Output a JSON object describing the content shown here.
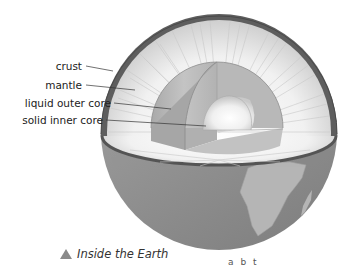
{
  "figure": {
    "labels": [
      {
        "id": "crust",
        "text": "crust"
      },
      {
        "id": "mantle",
        "text": "mantle"
      },
      {
        "id": "outer-core",
        "text": "liquid outer core"
      },
      {
        "id": "inner-core",
        "text": "solid inner core"
      }
    ],
    "caption": {
      "icon": "triangle-up-icon",
      "text": "Inside the Earth"
    },
    "fragment_text": "a b t",
    "colors": {
      "crust": "#5e5e5e",
      "mantle_light": "#f4f4f4",
      "mantle_streak": "#bdbdbd",
      "outer_core": "#b4b4b4",
      "inner_core": "#f5f5f5",
      "ocean": "#8a8a8a",
      "continent": "#b5b5b5",
      "caption_icon": "#8a8a8a",
      "label_text": "#222222",
      "leader_line": "#333333"
    }
  }
}
